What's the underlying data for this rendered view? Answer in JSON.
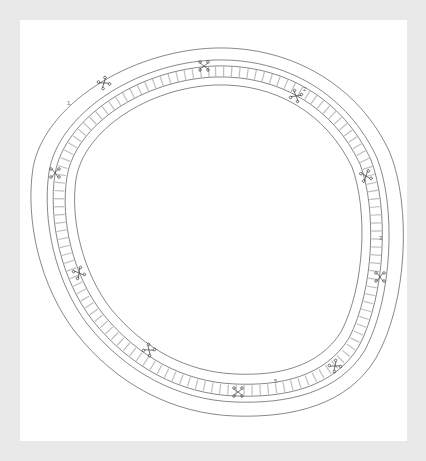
{
  "drawing": {
    "title": "",
    "labels": [
      {
        "id": "label-1",
        "text": "1",
        "x": 67,
        "y": 105
      },
      {
        "id": "label-2",
        "text": "2",
        "x": 303,
        "y": 91
      },
      {
        "id": "label-3",
        "text": "3",
        "x": 379,
        "y": 240
      },
      {
        "id": "label-5",
        "text": "5",
        "x": 274,
        "y": 383
      }
    ],
    "colors": {
      "background": "#e9e9e9",
      "panel": "#ffffff",
      "line": "#555555",
      "cell": "#777777"
    }
  }
}
